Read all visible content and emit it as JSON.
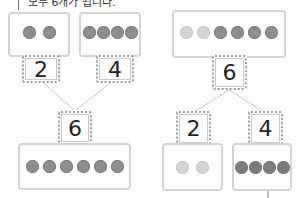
{
  "caption": "모두 6개가 됩니다.",
  "left_diagram": {
    "parts": [
      {
        "number": "2",
        "dots": 2
      },
      {
        "number": "4",
        "dots": 4
      }
    ],
    "whole": {
      "number": "6",
      "dots": 6
    }
  },
  "right_diagram": {
    "whole": {
      "number": "6",
      "dots": 6,
      "light_dots": 2,
      "dark_dots": 4
    },
    "parts": [
      {
        "number": "2",
        "dots": 2,
        "tone": "light"
      },
      {
        "number": "4",
        "dots": 4,
        "tone": "dark"
      }
    ]
  },
  "colors": {
    "box_border": "#d2d2d2",
    "number_border": "#9a9a9a",
    "dot_dark": "#8e8e8e",
    "dot_light": "#d4d4d4",
    "line": "#c4c4c4"
  }
}
